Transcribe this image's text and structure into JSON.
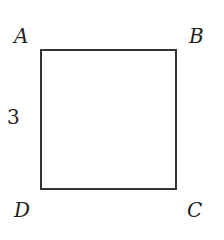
{
  "diagram": {
    "shape": "square",
    "vertices": {
      "top_left": "A",
      "top_right": "B",
      "bottom_right": "C",
      "bottom_left": "D"
    },
    "side_label": "3"
  }
}
